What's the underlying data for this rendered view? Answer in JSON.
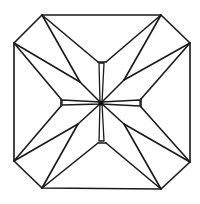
{
  "diagram": {
    "stroke_color": "#1a1a1a",
    "background": "#ffffff",
    "outline_octagon": [
      [
        42,
        15
      ],
      [
        161,
        15
      ],
      [
        190,
        43
      ],
      [
        190,
        162
      ],
      [
        161,
        189
      ],
      [
        42,
        188
      ],
      [
        14,
        161
      ],
      [
        14,
        43
      ]
    ],
    "center": [
      101,
      103
    ],
    "notches": {
      "top": {
        "tip": [
          [
            98,
            62
          ],
          [
            106,
            62
          ]
        ],
        "inner": [
          [
            99,
            63
          ],
          [
            104,
            63
          ]
        ]
      },
      "right": {
        "tip": [
          [
            141,
            99
          ],
          [
            141,
            107
          ]
        ],
        "inner": [
          [
            140,
            100
          ],
          [
            140,
            106
          ]
        ]
      },
      "bottom": {
        "tip": [
          [
            98,
            143
          ],
          [
            106,
            143
          ]
        ],
        "inner": [
          [
            99,
            141
          ],
          [
            104,
            141
          ]
        ]
      },
      "left": {
        "tip": [
          [
            61,
            99
          ],
          [
            61,
            106
          ]
        ],
        "inner": [
          [
            62,
            100
          ],
          [
            62,
            105
          ]
        ]
      }
    },
    "junctions": {
      "nw": [
        80,
        82
      ],
      "ne": [
        124,
        80
      ],
      "se": [
        124,
        124
      ],
      "sw": [
        78,
        124
      ]
    }
  },
  "caption": {
    "text": "",
    "note": "illegible, cut off at bottom edge"
  }
}
